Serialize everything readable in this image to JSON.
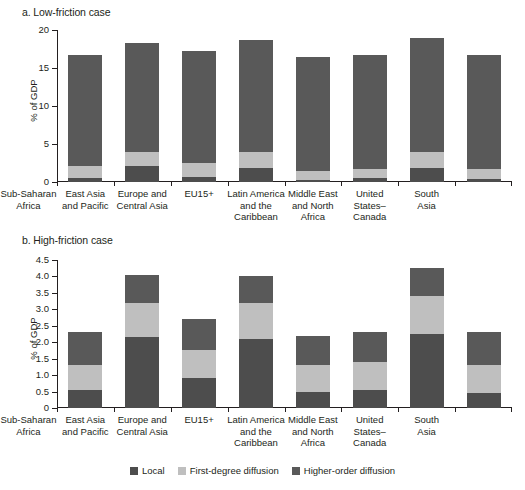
{
  "figure": {
    "panel_a_title": "a. Low-friction case",
    "panel_b_title": "b. High-friction case"
  },
  "legend": {
    "items": [
      {
        "label": "Local",
        "color": "#4d4d4d"
      },
      {
        "label": "First-degree diffusion",
        "color": "#bfbfbf"
      },
      {
        "label": "Higher-order diffusion",
        "color": "#595959"
      }
    ]
  },
  "chart_data": [
    {
      "type": "bar",
      "id": "panel-a",
      "title": "a. Low-friction case",
      "stacked": true,
      "xlabel": "",
      "ylabel": "% of GDP",
      "ylim": [
        0,
        20
      ],
      "yticks": [
        0,
        5,
        10,
        15,
        20
      ],
      "ytick_labels": [
        "0",
        "5",
        "10",
        "15",
        "20"
      ],
      "grid": false,
      "legend_position": "bottom",
      "categories": [
        "Sub-Saharan\nAfrica",
        "East Asia\nand Pacific",
        "Europe and\nCentral Asia",
        "EU15+",
        "Latin America\nand the\nCaribbean",
        "Middle East\nand North\nAfrica",
        "United\nStates–\nCanada",
        "South\nAsia"
      ],
      "series": [
        {
          "name": "Local",
          "color": "#4d4d4d",
          "values": [
            0.5,
            2.1,
            0.7,
            1.9,
            0.3,
            0.5,
            1.9,
            0.4
          ]
        },
        {
          "name": "First-degree diffusion",
          "color": "#bfbfbf",
          "values": [
            1.6,
            1.9,
            1.8,
            2.0,
            1.1,
            1.2,
            2.1,
            1.3
          ]
        },
        {
          "name": "Higher-order diffusion",
          "color": "#595959",
          "values": [
            14.6,
            14.3,
            14.8,
            14.8,
            15.1,
            15.0,
            15.0,
            15.0
          ]
        }
      ],
      "totals": [
        16.7,
        18.3,
        17.3,
        18.7,
        16.5,
        16.7,
        19.0,
        16.7
      ]
    },
    {
      "type": "bar",
      "id": "panel-b",
      "title": "b. High-friction case",
      "stacked": true,
      "xlabel": "",
      "ylabel": "% of GDP",
      "ylim": [
        0,
        4.5
      ],
      "yticks": [
        0,
        0.5,
        1.0,
        1.5,
        2.0,
        2.5,
        3.0,
        3.5,
        4.0,
        4.5
      ],
      "ytick_labels": [
        "0",
        "0.5",
        "1.0",
        "1.5",
        "2.0",
        "2.5",
        "3.0",
        "3.5",
        "4.0",
        "4.5"
      ],
      "grid": false,
      "legend_position": "bottom",
      "categories": [
        "Sub-Saharan\nAfrica",
        "East Asia\nand Pacific",
        "Europe and\nCentral Asia",
        "EU15+",
        "Latin America\nand the\nCaribbean",
        "Middle East\nand North\nAfrica",
        "United\nStates–\nCanada",
        "South\nAsia"
      ],
      "series": [
        {
          "name": "Local",
          "color": "#4d4d4d",
          "values": [
            0.55,
            2.15,
            0.9,
            2.1,
            0.5,
            0.55,
            2.25,
            0.45
          ]
        },
        {
          "name": "First-degree diffusion",
          "color": "#bfbfbf",
          "values": [
            0.75,
            1.05,
            0.85,
            1.1,
            0.8,
            0.85,
            1.15,
            0.85
          ]
        },
        {
          "name": "Higher-order diffusion",
          "color": "#595959",
          "values": [
            1.0,
            0.85,
            0.95,
            0.8,
            0.9,
            0.9,
            0.85,
            1.0
          ]
        }
      ],
      "totals": [
        2.3,
        4.05,
        2.7,
        4.0,
        2.2,
        2.3,
        4.25,
        2.3
      ]
    }
  ]
}
